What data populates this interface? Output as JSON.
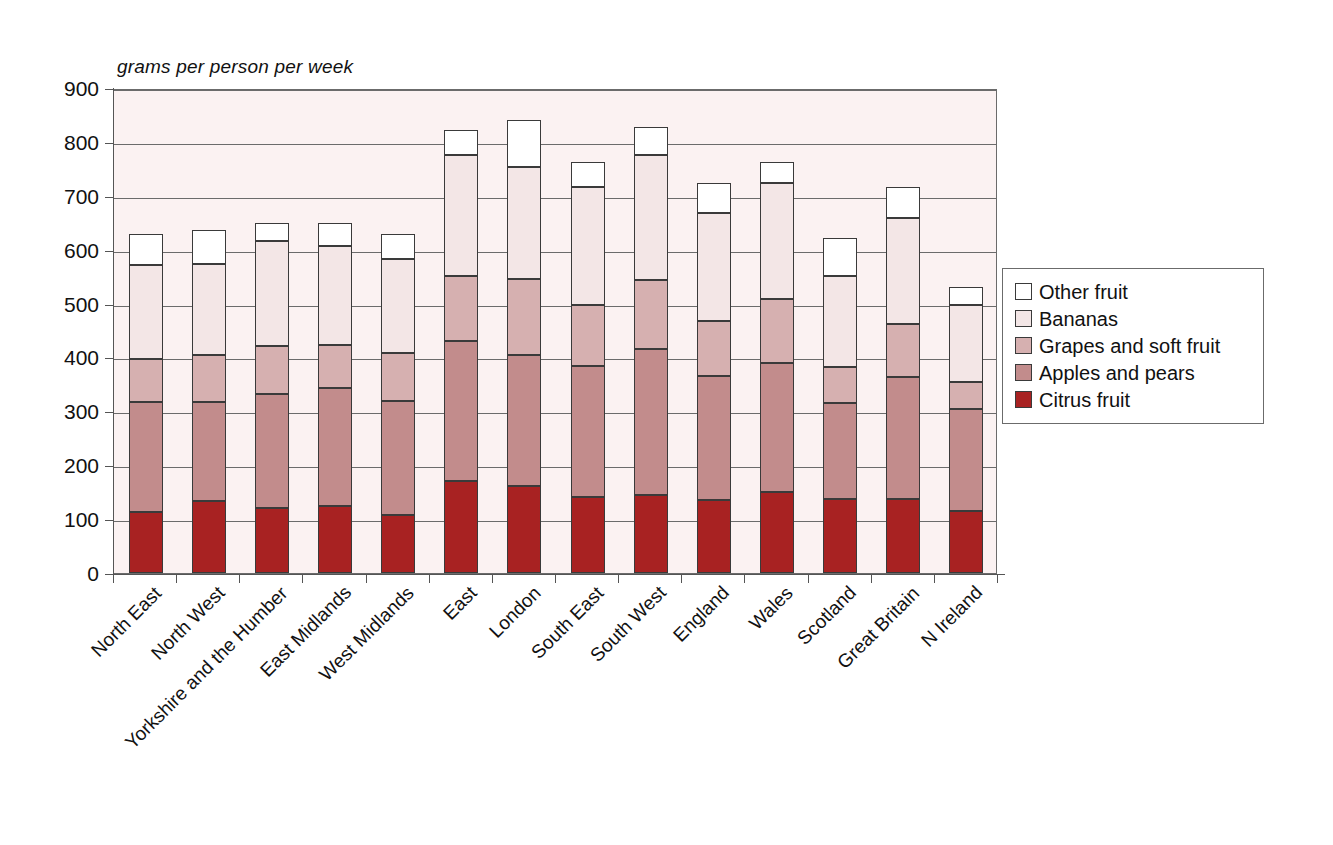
{
  "chart_data": {
    "type": "bar",
    "subtype": "stacked-vertical",
    "title": "",
    "axis_note": "grams per person per week",
    "xlabel": "",
    "ylabel": "grams per person per week",
    "ylim": [
      0,
      900
    ],
    "ytick_step": 100,
    "yticks": [
      0,
      100,
      200,
      300,
      400,
      500,
      600,
      700,
      800,
      900
    ],
    "ytick_labels": [
      "0",
      "100",
      "200",
      "300",
      "400",
      "500",
      "600",
      "700",
      "800",
      "900"
    ],
    "grid": true,
    "legend_position": "right",
    "categories": [
      "North East",
      "North West",
      "Yorkshire and the Humber",
      "East Midlands",
      "West Midlands",
      "East",
      "London",
      "South East",
      "South West",
      "England",
      "Wales",
      "Scotland",
      "Great Britain",
      "N Ireland"
    ],
    "series": [
      {
        "name": "Citrus fruit",
        "color": "#a82222",
        "values": [
          114,
          133,
          121,
          124,
          108,
          171,
          161,
          141,
          145,
          135,
          151,
          137,
          137,
          116
        ]
      },
      {
        "name": "Apples and pears",
        "color": "#c28c8c",
        "values": [
          204,
          184,
          212,
          219,
          211,
          259,
          243,
          243,
          270,
          230,
          239,
          178,
          226,
          189
        ]
      },
      {
        "name": "Grapes and soft fruit",
        "color": "#d6b0b0",
        "values": [
          79,
          87,
          88,
          80,
          89,
          121,
          141,
          113,
          128,
          103,
          118,
          68,
          99,
          49
        ]
      },
      {
        "name": "Bananas",
        "color": "#f3e6e6",
        "values": [
          174,
          170,
          196,
          184,
          174,
          225,
          209,
          220,
          233,
          200,
          216,
          168,
          197,
          144
        ]
      },
      {
        "name": "Other fruit",
        "color": "#ffffff",
        "values": [
          59,
          62,
          32,
          43,
          48,
          46,
          86,
          46,
          52,
          55,
          38,
          71,
          57,
          33
        ]
      }
    ],
    "totals": [
      630,
      636,
      649,
      650,
      630,
      822,
      840,
      763,
      828,
      723,
      762,
      622,
      716,
      531
    ],
    "colors": {
      "plot_background": "#fbf2f2",
      "axis": "#555555",
      "gridline": "#6b6b6b",
      "bar_outline": "#3a3a3a",
      "page_background": "#ffffff"
    }
  },
  "legend": {
    "entries": [
      {
        "label": "Other fruit",
        "color": "#ffffff"
      },
      {
        "label": "Bananas",
        "color": "#f3e6e6"
      },
      {
        "label": "Grapes and soft fruit",
        "color": "#d6b0b0"
      },
      {
        "label": "Apples and pears",
        "color": "#c28c8c"
      },
      {
        "label": "Citrus fruit",
        "color": "#a82222"
      }
    ]
  }
}
